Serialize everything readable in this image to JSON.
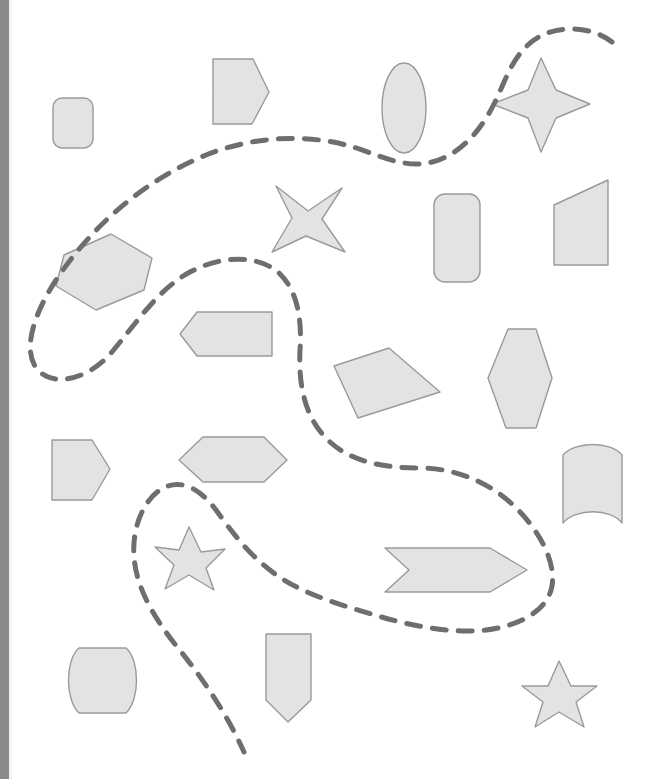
{
  "canvas": {
    "width": 651,
    "height": 779,
    "background_color": "#ffffff",
    "left_gutter_color": "#8a8a8a",
    "title": "Geometric shapes worksheet"
  },
  "style": {
    "shape_fill": "#e3e3e3",
    "shape_stroke": "#9a9a9a",
    "shape_stroke_width": 1.4,
    "path_stroke": "#6e6e6e",
    "path_stroke_width": 5,
    "path_dash": "14 12"
  },
  "dashed_path": {
    "name": "dashed-curve",
    "segments": [
      {
        "id": "path-upper",
        "description": "long dashed curve entering top-right, sweeping left and looping down the left side",
        "d": "M 612 42 C 592 26 556 24 534 40 C 512 56 506 80 494 104 C 478 136 456 156 432 162 C 402 170 374 152 346 145 C 300 133 248 138 206 155 C 150 178 96 220 56 280 C 30 320 22 356 40 372 C 58 388 92 376 112 352 C 140 318 160 288 190 272 C 220 256 256 254 278 272 C 298 290 302 320 300 350 C 298 392 308 422 330 442 C 352 462 384 468 420 468 C 452 468 486 480 512 504 C 540 530 556 562 552 586 C 548 610 520 626 486 630 C 452 634 412 626 378 616 C 344 606 310 596 284 580 C 252 560 232 532 216 510 C 198 486 178 478 160 490 C 142 502 132 530 134 556 C 136 588 154 618 178 648 C 204 680 228 716 244 752"
      }
    ]
  },
  "shapes": [
    {
      "id": "rounded-rect-top-left",
      "name": "rounded-rectangle",
      "kind": "rounded-rect",
      "x": 53,
      "y": 98,
      "width": 40,
      "height": 50,
      "radius": 9,
      "rotation": 0
    },
    {
      "id": "pentagon-arrow-top",
      "name": "right-pointing-pentagon",
      "kind": "polygon",
      "points": "213,59 253,59 269,92 252,124 213,124"
    },
    {
      "id": "ellipse-top",
      "name": "ellipse",
      "kind": "ellipse",
      "cx": 404,
      "cy": 108,
      "rx": 22,
      "ry": 45
    },
    {
      "id": "four-point-star-top-right",
      "name": "four-pointed-star",
      "kind": "polygon",
      "points": "541,58 556,90 590,104 556,118 541,152 528,118 492,104 528,90"
    },
    {
      "id": "four-point-star-middle",
      "name": "four-pointed-star-rotated",
      "kind": "polygon",
      "points": "276,186 308,211 342,188 322,219 345,252 306,236 272,252 292,218"
    },
    {
      "id": "hexagon-rotated-left",
      "name": "rotated-hexagon",
      "kind": "polygon",
      "points": "111,234 152,258 144,290 96,310 56,286 64,255"
    },
    {
      "id": "rounded-rect-right",
      "name": "rounded-rectangle-tall",
      "kind": "rounded-rect",
      "x": 434,
      "y": 194,
      "width": 46,
      "height": 88,
      "radius": 11,
      "rotation": 0
    },
    {
      "id": "quad-top-right",
      "name": "trapezoid-quadrilateral",
      "kind": "polygon",
      "points": "608,180 608,265 554,265 554,205"
    },
    {
      "id": "pentagon-left-pointing",
      "name": "left-pointing-pentagon",
      "kind": "polygon",
      "points": "197,312 272,312 272,356 197,356 180,334"
    },
    {
      "id": "quad-rotated-middle",
      "name": "rotated-quadrilateral",
      "kind": "polygon",
      "points": "389,348 440,392 358,418 334,366"
    },
    {
      "id": "hexagon-vertical-right",
      "name": "vertical-hexagon",
      "kind": "polygon",
      "points": "508,329 536,329 552,378 536,428 506,428 488,378"
    },
    {
      "id": "pentagon-left-lower",
      "name": "right-pointing-pentagon-small",
      "kind": "polygon",
      "points": "52,440 92,440 110,469 92,500 52,500"
    },
    {
      "id": "hexagon-horizontal",
      "name": "horizontal-hexagon",
      "kind": "polygon",
      "points": "203,437 264,437 287,460 264,482 203,482 179,460"
    },
    {
      "id": "curved-rect-right",
      "name": "curved-top-bottom-rectangle",
      "kind": "path",
      "d": "M 563 455 C 575 441 611 441 622 455 L 622 523 C 611 508 575 508 563 523 Z"
    },
    {
      "id": "five-point-star-middle",
      "name": "five-pointed-star",
      "kind": "polygon",
      "points": "189,527 201,552 225,549 206,568 214,590 189,575 165,589 174,565 155,547 179,550"
    },
    {
      "id": "chevron-banner",
      "name": "chevron-arrow-banner",
      "kind": "polygon",
      "points": "385,548 490,548 527,570 490,592 385,592 409,570"
    },
    {
      "id": "curved-rect-bottom-left",
      "name": "curved-side-rectangle",
      "kind": "path",
      "d": "M 79 648 L 126 648 C 140 660 140 700 126 713 L 79 713 C 65 700 65 660 79 648 Z"
    },
    {
      "id": "pennant-bottom",
      "name": "downward-pennant",
      "kind": "polygon",
      "points": "266,634 311,634 311,700 288,722 266,700"
    },
    {
      "id": "five-point-star-bottom-right",
      "name": "five-pointed-star-small",
      "kind": "polygon",
      "points": "559,661 571,686 597,686 576,702 584,727 559,712 535,727 543,702 522,686 548,686"
    }
  ]
}
